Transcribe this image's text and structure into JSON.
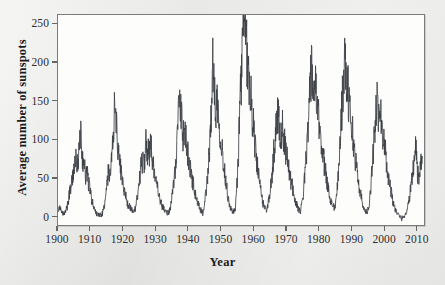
{
  "chart_data": {
    "type": "line",
    "title": "",
    "xlabel": "Year",
    "ylabel": "Average number of sunspots",
    "xlim": [
      1900,
      2012.5
    ],
    "ylim": [
      -12,
      262
    ],
    "xticks": [
      1900,
      1910,
      1920,
      1930,
      1940,
      1950,
      1960,
      1970,
      1980,
      1990,
      2000,
      2010
    ],
    "yticks": [
      0,
      50,
      100,
      150,
      200,
      250
    ],
    "grid": false,
    "legend": null,
    "series_name": "Average number of sunspots",
    "line_color": "#3c3f45",
    "plot_background": "#fdfdfc",
    "figure_background": "#e9e9e7",
    "x": [
      1900.0,
      1900.5,
      1901.0,
      1901.5,
      1902.0,
      1902.5,
      1903.0,
      1903.5,
      1904.0,
      1904.5,
      1905.0,
      1905.5,
      1906.0,
      1906.5,
      1907.0,
      1907.5,
      1908.0,
      1908.5,
      1909.0,
      1909.5,
      1910.0,
      1910.5,
      1911.0,
      1911.5,
      1912.0,
      1912.5,
      1913.0,
      1913.5,
      1914.0,
      1914.5,
      1915.0,
      1915.5,
      1916.0,
      1916.5,
      1917.0,
      1917.5,
      1918.0,
      1918.5,
      1919.0,
      1919.5,
      1920.0,
      1920.5,
      1921.0,
      1921.5,
      1922.0,
      1922.5,
      1923.0,
      1923.5,
      1924.0,
      1924.5,
      1925.0,
      1925.5,
      1926.0,
      1926.5,
      1927.0,
      1927.5,
      1928.0,
      1928.5,
      1929.0,
      1929.5,
      1930.0,
      1930.5,
      1931.0,
      1931.5,
      1932.0,
      1932.5,
      1933.0,
      1933.5,
      1934.0,
      1934.5,
      1935.0,
      1935.5,
      1936.0,
      1936.5,
      1937.0,
      1937.5,
      1938.0,
      1938.5,
      1939.0,
      1939.5,
      1940.0,
      1940.5,
      1941.0,
      1941.5,
      1942.0,
      1942.5,
      1943.0,
      1943.5,
      1944.0,
      1944.5,
      1945.0,
      1945.5,
      1946.0,
      1946.5,
      1947.0,
      1947.5,
      1948.0,
      1948.5,
      1949.0,
      1949.5,
      1950.0,
      1950.5,
      1951.0,
      1951.5,
      1952.0,
      1952.5,
      1953.0,
      1953.5,
      1954.0,
      1954.5,
      1955.0,
      1955.5,
      1956.0,
      1956.5,
      1957.0,
      1957.5,
      1958.0,
      1958.5,
      1959.0,
      1959.5,
      1960.0,
      1960.5,
      1961.0,
      1961.5,
      1962.0,
      1962.5,
      1963.0,
      1963.5,
      1964.0,
      1964.5,
      1965.0,
      1965.5,
      1966.0,
      1966.5,
      1967.0,
      1967.5,
      1968.0,
      1968.5,
      1969.0,
      1969.5,
      1970.0,
      1970.5,
      1971.0,
      1971.5,
      1972.0,
      1972.5,
      1973.0,
      1973.5,
      1974.0,
      1974.5,
      1975.0,
      1975.5,
      1976.0,
      1976.5,
      1977.0,
      1977.5,
      1978.0,
      1978.5,
      1979.0,
      1979.5,
      1980.0,
      1980.5,
      1981.0,
      1981.5,
      1982.0,
      1982.5,
      1983.0,
      1983.5,
      1984.0,
      1984.5,
      1985.0,
      1985.5,
      1986.0,
      1986.5,
      1987.0,
      1987.5,
      1988.0,
      1988.5,
      1989.0,
      1989.5,
      1990.0,
      1990.5,
      1991.0,
      1991.5,
      1992.0,
      1992.5,
      1993.0,
      1993.5,
      1994.0,
      1994.5,
      1995.0,
      1995.5,
      1996.0,
      1996.5,
      1997.0,
      1997.5,
      1998.0,
      1998.5,
      1999.0,
      1999.5,
      2000.0,
      2000.5,
      2001.0,
      2001.5,
      2002.0,
      2002.5,
      2003.0,
      2003.5,
      2004.0,
      2004.5,
      2005.0,
      2005.5,
      2006.0,
      2006.5,
      2007.0,
      2007.5,
      2008.0,
      2008.5,
      2009.0,
      2009.5,
      2010.0,
      2010.5,
      2011.0,
      2011.5,
      2012.0
    ],
    "values": [
      9,
      12,
      4,
      2,
      2,
      7,
      14,
      28,
      37,
      52,
      58,
      70,
      64,
      88,
      105,
      72,
      66,
      52,
      55,
      40,
      28,
      18,
      10,
      5,
      2,
      1,
      1,
      1,
      8,
      16,
      38,
      56,
      52,
      72,
      98,
      153,
      112,
      85,
      70,
      52,
      42,
      30,
      22,
      14,
      12,
      9,
      5,
      6,
      12,
      28,
      46,
      62,
      70,
      66,
      98,
      82,
      78,
      96,
      65,
      62,
      48,
      36,
      24,
      18,
      12,
      8,
      6,
      4,
      3,
      8,
      22,
      42,
      58,
      92,
      128,
      143,
      120,
      100,
      112,
      86,
      78,
      64,
      50,
      42,
      30,
      22,
      15,
      10,
      6,
      3,
      12,
      30,
      52,
      80,
      122,
      198,
      160,
      140,
      150,
      122,
      100,
      82,
      62,
      48,
      32,
      18,
      10,
      6,
      4,
      8,
      38,
      88,
      142,
      196,
      250,
      222,
      212,
      185,
      162,
      140,
      118,
      96,
      72,
      56,
      38,
      28,
      16,
      10,
      8,
      12,
      24,
      40,
      62,
      88,
      110,
      132,
      120,
      104,
      112,
      98,
      84,
      70,
      58,
      46,
      38,
      28,
      18,
      12,
      8,
      6,
      14,
      32,
      58,
      90,
      128,
      165,
      184,
      158,
      172,
      140,
      126,
      112,
      92,
      76,
      62,
      48,
      36,
      26,
      18,
      12,
      10,
      18,
      42,
      78,
      120,
      158,
      196,
      180,
      168,
      145,
      128,
      108,
      88,
      70,
      54,
      40,
      28,
      18,
      11,
      6,
      4,
      10,
      28,
      56,
      88,
      116,
      144,
      128,
      138,
      118,
      102,
      86,
      68,
      52,
      40,
      28,
      18,
      10,
      5,
      2,
      -2,
      -4,
      -3,
      0,
      4,
      10,
      22,
      38,
      56,
      72,
      92,
      55,
      48,
      62,
      78
    ],
    "peaks": [
      {
        "year": 1906,
        "value": 105
      },
      {
        "year": 1917,
        "value": 153
      },
      {
        "year": 1928,
        "value": 98
      },
      {
        "year": 1937,
        "value": 143
      },
      {
        "year": 1947,
        "value": 198
      },
      {
        "year": 1957,
        "value": 250
      },
      {
        "year": 1969,
        "value": 132
      },
      {
        "year": 1979,
        "value": 184
      },
      {
        "year": 1989,
        "value": 196
      },
      {
        "year": 2000,
        "value": 144
      },
      {
        "year": 2012,
        "value": 92
      }
    ]
  },
  "axis": {
    "xlabel": "Year",
    "ylabel": "Average number of sunspots",
    "xtick_labels": [
      "1900",
      "1910",
      "1920",
      "1930",
      "1940",
      "1950",
      "1960",
      "1970",
      "1980",
      "1990",
      "2000",
      "2010"
    ],
    "ytick_labels": [
      "0",
      "50",
      "100",
      "150",
      "200",
      "250"
    ]
  }
}
